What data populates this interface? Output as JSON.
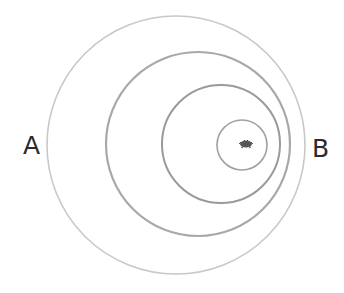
{
  "diagram": {
    "type": "nested-circles",
    "labels": {
      "left": "A",
      "right": "B"
    },
    "circles": [
      {
        "name": "outer-circle",
        "cx": 176,
        "cy": 145,
        "r": 129,
        "stroke": "#c8c8c8",
        "width": 1.6
      },
      {
        "name": "second-circle",
        "cx": 198,
        "cy": 144,
        "r": 92,
        "stroke": "#a8a8a8",
        "width": 2.2
      },
      {
        "name": "third-circle",
        "cx": 221,
        "cy": 144,
        "r": 59,
        "stroke": "#9a9a9a",
        "width": 2.0
      },
      {
        "name": "inner-circle",
        "cx": 242,
        "cy": 145,
        "r": 25,
        "stroke": "#a0a0a0",
        "width": 1.6
      }
    ],
    "center_mark": {
      "cx": 246,
      "cy": 144,
      "color": "#555555"
    }
  }
}
